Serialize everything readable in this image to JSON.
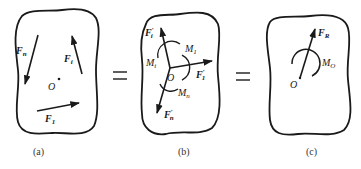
{
  "figure": {
    "panels": [
      {
        "id": "a",
        "caption": "(a)",
        "forces": [
          {
            "name": "F",
            "sub": "n",
            "prime": ""
          },
          {
            "name": "F",
            "sub": "i",
            "prime": ""
          },
          {
            "name": "F",
            "sub": "1",
            "prime": ""
          }
        ],
        "point": "O"
      },
      {
        "id": "b",
        "caption": "(b)",
        "forces": [
          {
            "name": "F",
            "sub": "i",
            "prime": "′"
          },
          {
            "name": "F",
            "sub": "1",
            "prime": "′"
          },
          {
            "name": "F",
            "sub": "n",
            "prime": "′"
          }
        ],
        "moments": [
          {
            "name": "M",
            "sub": "1"
          },
          {
            "name": "M",
            "sub": "i"
          },
          {
            "name": "M",
            "sub": "n"
          }
        ],
        "point": "O"
      },
      {
        "id": "c",
        "caption": "(c)",
        "forces": [
          {
            "name": "F",
            "sub": "R",
            "prime": ""
          }
        ],
        "moments": [
          {
            "name": "M",
            "sub": "O"
          }
        ],
        "point": "O"
      }
    ],
    "operators": [
      "=",
      "="
    ],
    "colors": {
      "ink": "#1a1a1a",
      "background": "#ffffff"
    }
  }
}
